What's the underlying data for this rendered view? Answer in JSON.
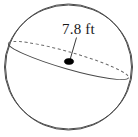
{
  "figure": {
    "type": "sphere-diagram",
    "label": "7.8 ft",
    "measurement": {
      "value": "7.8",
      "unit": "ft",
      "quantity": "diameter"
    },
    "colors": {
      "outline": "#4a4a4a",
      "dashed": "#6b6b6b",
      "center_dot": "#000000",
      "leader": "#3a3a3a",
      "background": "#ffffff",
      "text": "#1a1a1a"
    },
    "geometry": {
      "sphere_center_x": 68.5,
      "sphere_center_y": 67,
      "sphere_radius_x": 64,
      "sphere_radius_y": 62,
      "ellipse_major_axis": 64.5,
      "ellipse_minor_axis": 17,
      "ellipse_tilt_degrees": 16,
      "center_dot_x": 69,
      "center_dot_y": 61.5,
      "leader_start_x": 76,
      "leader_start_y": 38,
      "leader_end_x": 70,
      "leader_end_y": 60
    }
  }
}
